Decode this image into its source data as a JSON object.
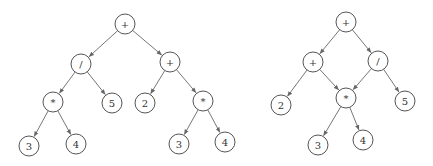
{
  "figure": {
    "node_radius": 10,
    "colors": {
      "stroke": "#555555",
      "edge": "#666666",
      "text": "#333333",
      "background": "#ffffff"
    }
  },
  "trees": [
    {
      "id": "expression-tree",
      "nodes": [
        {
          "id": "t1",
          "label": "+",
          "x": 125,
          "y": 24
        },
        {
          "id": "t2",
          "label": "/",
          "x": 81,
          "y": 64
        },
        {
          "id": "t3",
          "label": "+",
          "x": 170,
          "y": 62
        },
        {
          "id": "t4",
          "label": "*",
          "x": 53,
          "y": 102
        },
        {
          "id": "t5",
          "label": "5",
          "x": 112,
          "y": 103
        },
        {
          "id": "t6",
          "label": "2",
          "x": 145,
          "y": 103
        },
        {
          "id": "t7",
          "label": "*",
          "x": 203,
          "y": 101
        },
        {
          "id": "t8",
          "label": "3",
          "x": 29,
          "y": 146
        },
        {
          "id": "t9",
          "label": "4",
          "x": 76,
          "y": 144
        },
        {
          "id": "t10",
          "label": "3",
          "x": 179,
          "y": 144
        },
        {
          "id": "t11",
          "label": "4",
          "x": 225,
          "y": 142
        }
      ],
      "edges": [
        [
          "t1",
          "t2"
        ],
        [
          "t1",
          "t3"
        ],
        [
          "t2",
          "t4"
        ],
        [
          "t2",
          "t5"
        ],
        [
          "t3",
          "t6"
        ],
        [
          "t3",
          "t7"
        ],
        [
          "t4",
          "t8"
        ],
        [
          "t4",
          "t9"
        ],
        [
          "t7",
          "t10"
        ],
        [
          "t7",
          "t11"
        ]
      ]
    },
    {
      "id": "dag",
      "nodes": [
        {
          "id": "d1",
          "label": "+",
          "x": 346,
          "y": 22
        },
        {
          "id": "d2",
          "label": "+",
          "x": 313,
          "y": 62
        },
        {
          "id": "d3",
          "label": "/",
          "x": 378,
          "y": 61
        },
        {
          "id": "d4",
          "label": "2",
          "x": 281,
          "y": 105
        },
        {
          "id": "d5",
          "label": "*",
          "x": 346,
          "y": 98
        },
        {
          "id": "d6",
          "label": "5",
          "x": 405,
          "y": 101
        },
        {
          "id": "d7",
          "label": "3",
          "x": 318,
          "y": 145
        },
        {
          "id": "d8",
          "label": "4",
          "x": 363,
          "y": 140
        }
      ],
      "edges": [
        [
          "d1",
          "d2"
        ],
        [
          "d1",
          "d3"
        ],
        [
          "d2",
          "d4"
        ],
        [
          "d2",
          "d5"
        ],
        [
          "d3",
          "d5"
        ],
        [
          "d3",
          "d6"
        ],
        [
          "d5",
          "d7"
        ],
        [
          "d5",
          "d8"
        ]
      ]
    }
  ]
}
